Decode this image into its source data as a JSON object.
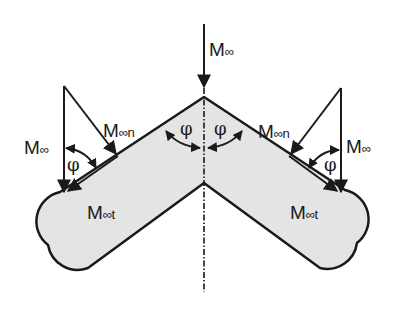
{
  "diagram": {
    "colors": {
      "stroke": "#1a1a1a",
      "body_fill": "#e4e4e4",
      "background": "#ffffff"
    },
    "labels": {
      "top_freestream": {
        "main": "M",
        "sub": "∞"
      },
      "left_freestream": {
        "main": "M",
        "sub": "∞"
      },
      "right_freestream": {
        "main": "M",
        "sub": "∞"
      },
      "left_normal": {
        "main": "M",
        "sub": "∞n"
      },
      "right_normal": {
        "main": "M",
        "sub": "∞n"
      },
      "left_tangential": {
        "main": "M",
        "sub": "∞t"
      },
      "right_tangential": {
        "main": "M",
        "sub": "∞t"
      }
    },
    "angles": {
      "apex_left": "φ",
      "apex_right": "φ",
      "left_triangle": "φ",
      "right_triangle": "φ"
    }
  }
}
